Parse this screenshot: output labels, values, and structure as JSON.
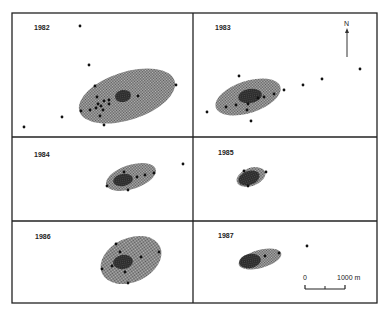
{
  "figure": {
    "type": "home-range ellipses by year",
    "north_label": "N",
    "scale_bar": {
      "start_label": "0",
      "end_label": "1000 m"
    },
    "colors": {
      "frame": "#222222",
      "ellipse_fill": "#8a8a8a",
      "core_fill": "#333333",
      "point": "#111111"
    }
  },
  "panels": [
    {
      "year": "1982",
      "ellipse": {
        "cx": 127,
        "cy": 96,
        "rx": 50,
        "ry": 24,
        "angle": -18
      },
      "core": {
        "cx": 123,
        "cy": 96,
        "rx": 8,
        "ry": 6,
        "angle": -10
      },
      "points": [
        [
          80,
          26
        ],
        [
          89,
          65
        ],
        [
          24,
          127
        ],
        [
          62,
          117
        ],
        [
          95,
          86
        ],
        [
          97,
          97
        ],
        [
          98,
          104
        ],
        [
          96,
          108
        ],
        [
          101,
          106
        ],
        [
          104,
          101
        ],
        [
          109,
          100
        ],
        [
          100,
          116
        ],
        [
          103,
          110
        ],
        [
          81,
          111
        ],
        [
          90,
          110
        ],
        [
          109,
          104
        ],
        [
          138,
          96
        ],
        [
          176,
          85
        ],
        [
          104,
          125
        ]
      ]
    },
    {
      "year": "1983",
      "ellipse": {
        "cx": 248,
        "cy": 97,
        "rx": 34,
        "ry": 16,
        "angle": -18
      },
      "core": {
        "cx": 250,
        "cy": 96,
        "rx": 12,
        "ry": 7,
        "angle": -10
      },
      "points": [
        [
          239,
          76
        ],
        [
          207,
          112
        ],
        [
          226,
          107
        ],
        [
          236,
          105
        ],
        [
          248,
          104
        ],
        [
          247,
          110
        ],
        [
          251,
          121
        ],
        [
          258,
          98
        ],
        [
          264,
          97
        ],
        [
          274,
          94
        ],
        [
          284,
          90
        ],
        [
          303,
          85
        ],
        [
          322,
          79
        ],
        [
          360,
          69
        ]
      ]
    },
    {
      "year": "1984",
      "ellipse": {
        "cx": 131,
        "cy": 177,
        "rx": 26,
        "ry": 12,
        "angle": -18
      },
      "core": {
        "cx": 123,
        "cy": 180,
        "rx": 10,
        "ry": 6,
        "angle": -10
      },
      "points": [
        [
          124,
          172
        ],
        [
          107,
          186
        ],
        [
          128,
          190
        ],
        [
          137,
          177
        ],
        [
          145,
          175
        ],
        [
          154,
          173
        ],
        [
          183,
          164
        ]
      ]
    },
    {
      "year": "1985",
      "ellipse": {
        "cx": 251,
        "cy": 177,
        "rx": 15,
        "ry": 9,
        "angle": -20
      },
      "core": {
        "cx": 249,
        "cy": 178,
        "rx": 11,
        "ry": 7,
        "angle": -20
      },
      "points": [
        [
          244,
          171
        ],
        [
          266,
          172
        ],
        [
          248,
          186
        ]
      ]
    },
    {
      "year": "1986",
      "ellipse": {
        "cx": 131,
        "cy": 260,
        "rx": 32,
        "ry": 22,
        "angle": -25
      },
      "core": {
        "cx": 123,
        "cy": 262,
        "rx": 10,
        "ry": 7,
        "angle": -10
      },
      "points": [
        [
          116,
          244
        ],
        [
          159,
          252
        ],
        [
          120,
          252
        ],
        [
          141,
          257
        ],
        [
          102,
          269
        ],
        [
          112,
          266
        ],
        [
          125,
          272
        ],
        [
          128,
          283
        ]
      ]
    },
    {
      "year": "1987",
      "ellipse": {
        "cx": 260,
        "cy": 259,
        "rx": 22,
        "ry": 9,
        "angle": -15
      },
      "core": {
        "cx": 250,
        "cy": 261,
        "rx": 11,
        "ry": 7,
        "angle": -10
      },
      "points": [
        [
          265,
          256
        ],
        [
          279,
          253
        ],
        [
          307,
          246
        ]
      ]
    }
  ]
}
